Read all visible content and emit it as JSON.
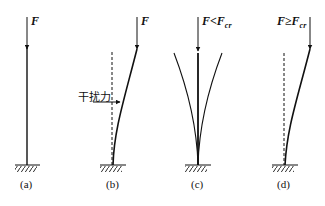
{
  "diagram": {
    "panels": [
      {
        "id": "a",
        "caption": "(a)",
        "force_label": "F",
        "force_sub": ""
      },
      {
        "id": "b",
        "caption": "(b)",
        "force_label": "F",
        "force_sub": "",
        "disturbance_label": "干扰力"
      },
      {
        "id": "c",
        "caption": "(c)",
        "force_label": "F<F",
        "force_sub": "cr"
      },
      {
        "id": "d",
        "caption": "(d)",
        "force_label": "F≥F",
        "force_sub": "cr"
      }
    ],
    "colors": {
      "line": "#111111",
      "background": "#ffffff"
    }
  }
}
